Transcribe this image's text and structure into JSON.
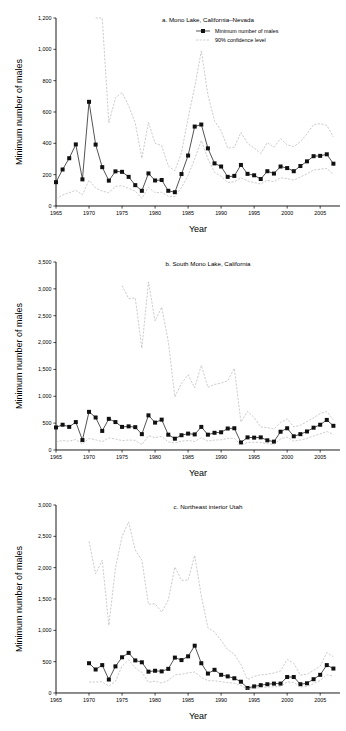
{
  "figure": {
    "axis_label_y": "Minimum number of males",
    "axis_label_x": "Year",
    "legend": {
      "series_label": "Minimum number of males",
      "ci_label": "90% confidence level"
    },
    "colors": {
      "series": "#1a1a1a",
      "ci": "#aaaaaa",
      "axis": "#000000"
    }
  },
  "chart_data": [
    {
      "type": "line",
      "title": "a. Mono Lake, California–Nevada",
      "xlabel": "Year",
      "ylabel": "Minimum number of males",
      "xlim": [
        1965,
        2008
      ],
      "ylim": [
        0,
        1200
      ],
      "yticks": [
        0,
        200,
        400,
        600,
        800,
        1000,
        1200
      ],
      "ytick_labels": [
        "0",
        "200",
        "400",
        "600",
        "800",
        "1,000",
        "1,200"
      ],
      "xticks": [
        1965,
        1970,
        1975,
        1980,
        1985,
        1990,
        1995,
        2000,
        2005
      ],
      "xtick_labels": [
        "1965",
        "1970",
        "1975",
        "1980",
        "1985",
        "1990",
        "1995",
        "2000",
        "2005"
      ],
      "grid": false,
      "legend_position": "top-right",
      "series": [
        {
          "name": "Minimum number of males",
          "style": "line-marker",
          "x": [
            1965,
            1966,
            1967,
            1968,
            1969,
            1970,
            1971,
            1972,
            1973,
            1974,
            1975,
            1976,
            1977,
            1978,
            1979,
            1980,
            1981,
            1982,
            1983,
            1984,
            1985,
            1986,
            1987,
            1988,
            1989,
            1990,
            1991,
            1992,
            1993,
            1994,
            1995,
            1996,
            1997,
            1998,
            1999,
            2000,
            2001,
            2002,
            2003,
            2004,
            2005,
            2006,
            2007
          ],
          "values": [
            152,
            233,
            305,
            393,
            170,
            665,
            392,
            248,
            162,
            221,
            218,
            186,
            133,
            97,
            208,
            163,
            166,
            97,
            88,
            204,
            322,
            507,
            520,
            368,
            272,
            252,
            186,
            192,
            262,
            205,
            196,
            172,
            222,
            207,
            252,
            242,
            222,
            255,
            285,
            318,
            320,
            330,
            270
          ]
        },
        {
          "name": "90% confidence level upper",
          "style": "dashed",
          "x": [
            1965,
            1966,
            1967,
            1968,
            1969,
            1970,
            1971,
            1972,
            1973,
            1974,
            1975,
            1976,
            1977,
            1978,
            1979,
            1980,
            1981,
            1982,
            1983,
            1984,
            1985,
            1986,
            1987,
            1988,
            1989,
            1990,
            1991,
            1992,
            1993,
            1994,
            1995,
            1996,
            1997,
            1998,
            1999,
            2000,
            2001,
            2002,
            2003,
            2004,
            2005,
            2006,
            2007
          ],
          "values": [
            null,
            null,
            null,
            null,
            null,
            null,
            1200,
            1200,
            530,
            690,
            725,
            640,
            530,
            305,
            535,
            400,
            385,
            255,
            225,
            340,
            560,
            760,
            990,
            710,
            545,
            480,
            370,
            375,
            470,
            400,
            370,
            335,
            405,
            375,
            430,
            390,
            380,
            410,
            460,
            520,
            525,
            515,
            440
          ]
        },
        {
          "name": "90% confidence level lower",
          "style": "dashed",
          "x": [
            1965,
            1966,
            1967,
            1968,
            1969,
            1970,
            1971,
            1972,
            1973,
            1974,
            1975,
            1976,
            1977,
            1978,
            1979,
            1980,
            1981,
            1982,
            1983,
            1984,
            1985,
            1986,
            1987,
            1988,
            1989,
            1990,
            1991,
            1992,
            1993,
            1994,
            1995,
            1996,
            1997,
            1998,
            1999,
            2000,
            2001,
            2002,
            2003,
            2004,
            2005,
            2006,
            2007
          ],
          "values": [
            45,
            70,
            85,
            100,
            72,
            165,
            115,
            95,
            85,
            125,
            130,
            112,
            95,
            48,
            120,
            85,
            88,
            62,
            60,
            118,
            195,
            300,
            418,
            300,
            215,
            190,
            150,
            155,
            180,
            160,
            150,
            140,
            165,
            155,
            180,
            175,
            165,
            185,
            205,
            230,
            235,
            240,
            200
          ]
        }
      ]
    },
    {
      "type": "line",
      "title": "b. South Mono Lake, California",
      "xlabel": "Year",
      "ylabel": "Minimum number of males",
      "xlim": [
        1965,
        2008
      ],
      "ylim": [
        0,
        3500
      ],
      "yticks": [
        0,
        500,
        1000,
        1500,
        2000,
        2500,
        3000,
        3500
      ],
      "ytick_labels": [
        "0",
        "500",
        "1,000",
        "1,500",
        "2,000",
        "2,500",
        "3,000",
        "3,500"
      ],
      "xticks": [
        1965,
        1970,
        1975,
        1980,
        1985,
        1990,
        1995,
        2000,
        2005
      ],
      "xtick_labels": [
        "1965",
        "1970",
        "1975",
        "1980",
        "1985",
        "1990",
        "1995",
        "2000",
        "2005"
      ],
      "grid": false,
      "legend_position": "none",
      "series": [
        {
          "name": "Minimum number of males",
          "style": "line-marker",
          "x": [
            1965,
            1966,
            1967,
            1968,
            1969,
            1970,
            1971,
            1972,
            1973,
            1974,
            1975,
            1976,
            1977,
            1978,
            1979,
            1980,
            1981,
            1982,
            1983,
            1984,
            1985,
            1986,
            1987,
            1988,
            1989,
            1990,
            1991,
            1992,
            1993,
            1994,
            1995,
            1996,
            1997,
            1998,
            1999,
            2000,
            2001,
            2002,
            2003,
            2004,
            2005,
            2006,
            2007
          ],
          "values": [
            420,
            470,
            430,
            520,
            185,
            710,
            605,
            355,
            580,
            520,
            430,
            440,
            425,
            295,
            645,
            510,
            565,
            285,
            210,
            275,
            305,
            290,
            430,
            285,
            320,
            330,
            400,
            405,
            140,
            235,
            230,
            235,
            180,
            155,
            340,
            405,
            255,
            295,
            345,
            415,
            470,
            560,
            450
          ]
        },
        {
          "name": "90% confidence level upper",
          "style": "dashed",
          "x": [
            1965,
            1966,
            1967,
            1968,
            1969,
            1970,
            1971,
            1972,
            1973,
            1974,
            1975,
            1976,
            1977,
            1978,
            1979,
            1980,
            1981,
            1982,
            1983,
            1984,
            1985,
            1986,
            1987,
            1988,
            1989,
            1990,
            1991,
            1992,
            1993,
            1994,
            1995,
            1996,
            1997,
            1998,
            1999,
            2000,
            2001,
            2002,
            2003,
            2004,
            2005,
            2006,
            2007
          ],
          "values": [
            null,
            null,
            null,
            null,
            null,
            null,
            null,
            null,
            null,
            null,
            3060,
            2820,
            2830,
            1895,
            3130,
            2400,
            2660,
            2020,
            990,
            1240,
            1400,
            1160,
            1575,
            1165,
            1220,
            1245,
            1290,
            1520,
            520,
            720,
            605,
            430,
            420,
            390,
            510,
            580,
            430,
            460,
            530,
            600,
            680,
            715,
            560
          ]
        },
        {
          "name": "90% confidence level lower",
          "style": "dashed",
          "x": [
            1965,
            1966,
            1967,
            1968,
            1969,
            1970,
            1971,
            1972,
            1973,
            1974,
            1975,
            1976,
            1977,
            1978,
            1979,
            1980,
            1981,
            1982,
            1983,
            1984,
            1985,
            1986,
            1987,
            1988,
            1989,
            1990,
            1991,
            1992,
            1993,
            1994,
            1995,
            1996,
            1997,
            1998,
            1999,
            2000,
            2001,
            2002,
            2003,
            2004,
            2005,
            2006,
            2007
          ],
          "values": [
            155,
            175,
            165,
            195,
            110,
            215,
            190,
            155,
            225,
            205,
            175,
            185,
            180,
            100,
            265,
            230,
            255,
            150,
            130,
            165,
            175,
            160,
            230,
            165,
            185,
            190,
            215,
            220,
            90,
            140,
            145,
            140,
            115,
            105,
            205,
            240,
            165,
            185,
            215,
            260,
            300,
            345,
            290
          ]
        }
      ]
    },
    {
      "type": "line",
      "title": "c. Northeast interior Utah",
      "xlabel": "Year",
      "ylabel": "Minimum number of males",
      "xlim": [
        1965,
        2008
      ],
      "ylim": [
        0,
        3000
      ],
      "yticks": [
        0,
        500,
        1000,
        1500,
        2000,
        2500,
        3000
      ],
      "ytick_labels": [
        "0",
        "500",
        "1,000",
        "1,500",
        "2,000",
        "2,500",
        "3,000"
      ],
      "xticks": [
        1965,
        1970,
        1975,
        1980,
        1985,
        1990,
        1995,
        2000,
        2005
      ],
      "xtick_labels": [
        "1965",
        "1970",
        "1975",
        "1980",
        "1985",
        "1990",
        "1995",
        "2000",
        "2005"
      ],
      "grid": false,
      "legend_position": "none",
      "series": [
        {
          "name": "Minimum number of males",
          "style": "line-marker",
          "x": [
            1970,
            1971,
            1972,
            1973,
            1974,
            1975,
            1976,
            1977,
            1978,
            1979,
            1980,
            1981,
            1982,
            1983,
            1984,
            1985,
            1986,
            1987,
            1988,
            1989,
            1990,
            1991,
            1992,
            1993,
            1994,
            1995,
            1996,
            1997,
            1998,
            1999,
            2000,
            2001,
            2002,
            2003,
            2004,
            2005,
            2006,
            2007
          ],
          "values": [
            475,
            375,
            445,
            215,
            425,
            570,
            640,
            520,
            490,
            340,
            355,
            345,
            385,
            565,
            525,
            585,
            755,
            475,
            310,
            370,
            290,
            265,
            235,
            180,
            80,
            105,
            125,
            140,
            150,
            150,
            255,
            255,
            140,
            155,
            220,
            290,
            445,
            390
          ]
        },
        {
          "name": "90% confidence level upper",
          "style": "dashed",
          "x": [
            1970,
            1971,
            1972,
            1973,
            1974,
            1975,
            1976,
            1977,
            1978,
            1979,
            1980,
            1981,
            1982,
            1983,
            1984,
            1985,
            1986,
            1987,
            1988,
            1989,
            1990,
            1991,
            1992,
            1993,
            1994,
            1995,
            1996,
            1997,
            1998,
            1999,
            2000,
            2001,
            2002,
            2003,
            2004,
            2005,
            2006,
            2007
          ],
          "values": [
            2420,
            1900,
            2120,
            1080,
            1990,
            2500,
            2730,
            2280,
            2120,
            1415,
            1425,
            1290,
            1485,
            2010,
            1800,
            1800,
            2195,
            1550,
            1040,
            975,
            840,
            690,
            620,
            450,
            215,
            265,
            290,
            300,
            320,
            350,
            535,
            475,
            285,
            300,
            360,
            430,
            645,
            580
          ]
        },
        {
          "name": "90% confidence level lower",
          "style": "dashed",
          "x": [
            1970,
            1971,
            1972,
            1973,
            1974,
            1975,
            1976,
            1977,
            1978,
            1979,
            1980,
            1981,
            1982,
            1983,
            1984,
            1985,
            1986,
            1987,
            1988,
            1989,
            1990,
            1991,
            1992,
            1993,
            1994,
            1995,
            1996,
            1997,
            1998,
            1999,
            2000,
            2001,
            2002,
            2003,
            2004,
            2005,
            2006,
            2007
          ],
          "values": [
            175,
            175,
            180,
            110,
            185,
            430,
            530,
            400,
            330,
            170,
            190,
            160,
            200,
            290,
            300,
            320,
            335,
            250,
            195,
            195,
            180,
            165,
            155,
            120,
            60,
            75,
            85,
            95,
            100,
            105,
            175,
            170,
            95,
            105,
            150,
            200,
            290,
            270
          ]
        }
      ]
    }
  ]
}
